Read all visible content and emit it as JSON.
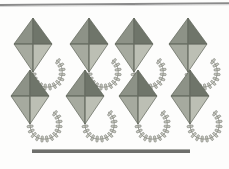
{
  "page": {
    "title": "Kites counting illustration",
    "background_color": "#fdfdfc",
    "width": 229,
    "height": 169
  },
  "top_rule": {
    "label": "top border line",
    "color": "#8a8a8a"
  },
  "bottom_rule": {
    "label": "bottom horizontal line",
    "color": "#6e6f6c"
  },
  "kite_style": {
    "panel_top_left_color": "#8d9287",
    "panel_top_right_color": "#6f756a",
    "panel_bottom_left_color": "#a6aa9f",
    "panel_bottom_right_color": "#bcbfb4",
    "outline_color": "#5f6459",
    "spar_color": "#6a6f64",
    "tail_string_color": "#8e9088",
    "tail_bow_color": "#c9cbc3",
    "tail_bow_outline_color": "#6b6d66"
  },
  "kites": {
    "count": 8,
    "rows": 2,
    "columns": 4,
    "items": [
      {
        "id": "kite-1",
        "row": 1,
        "column": 1,
        "x": 3,
        "y": 14,
        "label": "kite 1"
      },
      {
        "id": "kite-2",
        "row": 1,
        "column": 2,
        "x": 59,
        "y": 14,
        "label": "kite 2"
      },
      {
        "id": "kite-3",
        "row": 1,
        "column": 3,
        "x": 104,
        "y": 14,
        "label": "kite 3"
      },
      {
        "id": "kite-4",
        "row": 1,
        "column": 4,
        "x": 158,
        "y": 14,
        "label": "kite 4"
      },
      {
        "id": "kite-5",
        "row": 2,
        "column": 1,
        "x": 0,
        "y": 66,
        "label": "kite 5"
      },
      {
        "id": "kite-6",
        "row": 2,
        "column": 2,
        "x": 55,
        "y": 66,
        "label": "kite 6"
      },
      {
        "id": "kite-7",
        "row": 2,
        "column": 3,
        "x": 108,
        "y": 66,
        "label": "kite 7"
      },
      {
        "id": "kite-8",
        "row": 2,
        "column": 4,
        "x": 160,
        "y": 66,
        "label": "kite 8"
      }
    ]
  }
}
